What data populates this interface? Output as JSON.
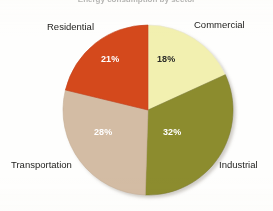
{
  "chart_title": "Energy consumption by sector",
  "chart_data": {
    "type": "pie",
    "title": "Energy consumption by sector",
    "categories": [
      "Commercial",
      "Industrial",
      "Transportation",
      "Residential"
    ],
    "values": [
      18,
      32,
      28,
      21
    ],
    "value_labels": [
      "18%",
      "32%",
      "28%",
      "21%"
    ],
    "units": "percent",
    "legend_position": "none",
    "grid": false,
    "slices": [
      {
        "label": "Commercial",
        "value": 18,
        "value_label": "18%",
        "color": "#f2f0b0",
        "label_text_color": "#2c2c28",
        "start_angle": 0,
        "end_angle": 64.8
      },
      {
        "label": "Industrial",
        "value": 32,
        "value_label": "32%",
        "color": "#8c8c2e",
        "label_text_color": "#ffffff",
        "start_angle": 64.8,
        "end_angle": 180.0
      },
      {
        "label": "Transportation",
        "value": 28,
        "value_label": "28%",
        "color": "#d3bca4",
        "label_text_color": "#ffffff",
        "start_angle": 180.0,
        "end_angle": 280.8
      },
      {
        "label": "Residential",
        "value": 21,
        "value_label": "21%",
        "color": "#d4491f",
        "label_text_color": "#ffffff",
        "start_angle": 280.8,
        "end_angle": 360.0
      }
    ]
  },
  "labels": {
    "residential": "Residential",
    "commercial": "Commercial",
    "industrial": "Industrial",
    "transportation": "Transportation"
  },
  "percents": {
    "commercial": "18%",
    "industrial": "32%",
    "transportation": "28%",
    "residential": "21%"
  },
  "colors": {
    "commercial": "#f2f0b0",
    "industrial": "#8c8c2e",
    "transportation": "#d3bca4",
    "residential": "#d4491f",
    "background": "#fefefd",
    "text": "#1d1d1b"
  }
}
